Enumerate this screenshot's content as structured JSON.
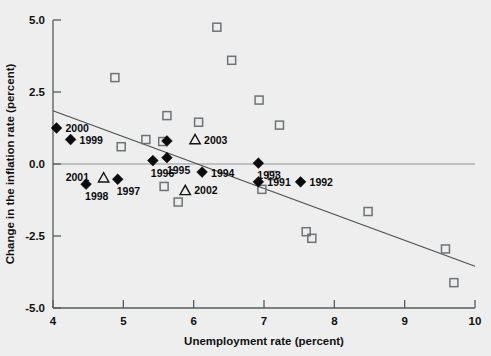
{
  "chart_data": {
    "type": "scatter",
    "title": "",
    "xlabel": "Unemployment rate (percent)",
    "ylabel": "Change in the inflation rate (percent)",
    "xlim": [
      4,
      10
    ],
    "ylim": [
      -5.0,
      5.0
    ],
    "xticks": [
      "4",
      "5",
      "6",
      "7",
      "8",
      "9",
      "10"
    ],
    "xtick_values": [
      4,
      5,
      6,
      7,
      8,
      9,
      10
    ],
    "yticks": [
      "5.0",
      "2.5",
      "0.0",
      "-2.5",
      "-5.0"
    ],
    "ytick_values": [
      5.0,
      2.5,
      0.0,
      -2.5,
      -5.0
    ],
    "grid": false,
    "legend": "none",
    "zero_line": 0.0,
    "trend_line": {
      "x_start": 4.0,
      "y_start": 1.85,
      "x_end": 10.0,
      "y_end": -3.55
    },
    "series": [
      {
        "name": "labeled-years",
        "marker": "filled-diamond",
        "points": [
          {
            "label": "2000",
            "x": 4.05,
            "y": 1.25,
            "label_dx": 9,
            "label_dy": 4
          },
          {
            "label": "1999",
            "x": 4.25,
            "y": 0.85,
            "label_dx": 9,
            "label_dy": 4
          },
          {
            "label": "1998",
            "x": 4.47,
            "y": -0.7,
            "label_dx": -1,
            "label_dy": 16
          },
          {
            "label": "1997",
            "x": 4.92,
            "y": -0.53,
            "label_dx": -1,
            "label_dy": 16
          },
          {
            "label": "1996",
            "x": 5.42,
            "y": 0.12,
            "label_dx": -2,
            "label_dy": 16
          },
          {
            "label": "1995",
            "x": 5.62,
            "y": 0.22,
            "label_dx": 0,
            "label_dy": 16
          },
          {
            "label": "1995b",
            "x": 5.62,
            "y": 0.8,
            "label_dx": 0,
            "label_dy": 0
          },
          {
            "label": "1994",
            "x": 6.12,
            "y": -0.28,
            "label_dx": 9,
            "label_dy": 5
          },
          {
            "label": "1993",
            "x": 6.92,
            "y": 0.03,
            "label_dx": -1,
            "label_dy": 16
          },
          {
            "label": "1991",
            "x": 6.92,
            "y": -0.62,
            "label_dx": 9,
            "label_dy": 4
          },
          {
            "label": "1992",
            "x": 7.52,
            "y": -0.62,
            "label_dx": 9,
            "label_dy": 4
          }
        ]
      },
      {
        "name": "labeled-projections",
        "marker": "open-triangle",
        "points": [
          {
            "label": "2001",
            "x": 4.72,
            "y": -0.48,
            "label_dx": -38,
            "label_dy": 3
          },
          {
            "label": "2003",
            "x": 6.02,
            "y": 0.85,
            "label_dx": 9,
            "label_dy": 4
          },
          {
            "label": "2002",
            "x": 5.88,
            "y": -0.92,
            "label_dx": 9,
            "label_dy": 4
          }
        ]
      },
      {
        "name": "historical-observations",
        "marker": "open-square",
        "points": [
          {
            "x": 6.33,
            "y": 4.75
          },
          {
            "x": 6.54,
            "y": 3.6
          },
          {
            "x": 4.88,
            "y": 3.0
          },
          {
            "x": 6.07,
            "y": 1.45
          },
          {
            "x": 6.93,
            "y": 2.22
          },
          {
            "x": 7.22,
            "y": 1.35
          },
          {
            "x": 5.32,
            "y": 0.85
          },
          {
            "x": 5.56,
            "y": 0.78
          },
          {
            "x": 4.97,
            "y": 0.6
          },
          {
            "x": 5.62,
            "y": 1.68
          },
          {
            "x": 7.12,
            "y": -0.4
          },
          {
            "x": 6.97,
            "y": -0.88
          },
          {
            "x": 5.58,
            "y": -0.78
          },
          {
            "x": 5.78,
            "y": -1.32
          },
          {
            "x": 8.48,
            "y": -1.65
          },
          {
            "x": 7.6,
            "y": -2.35
          },
          {
            "x": 7.68,
            "y": -2.58
          },
          {
            "x": 9.58,
            "y": -2.95
          },
          {
            "x": 9.7,
            "y": -4.12
          }
        ]
      }
    ]
  },
  "axes": {
    "x_title": "Unemployment rate (percent)",
    "y_title": "Change in the inflation rate (percent)"
  },
  "colors": {
    "background": "#eeeeee",
    "axis": "#555b5e",
    "marker_filled": "#0b0b0b",
    "marker_open": "#6d7376",
    "trend": "#4a4f52"
  }
}
